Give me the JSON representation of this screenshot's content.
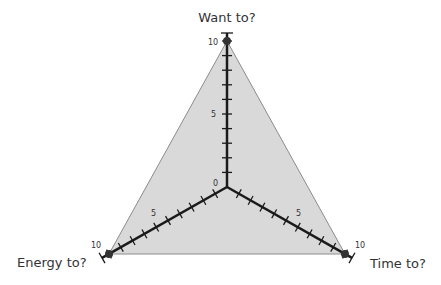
{
  "chart_data": {
    "type": "radar",
    "title": "",
    "axes": [
      {
        "name": "Want to?",
        "min": 0,
        "max": 10,
        "labeled_ticks": [
          0,
          5,
          10
        ]
      },
      {
        "name": "Time to?",
        "min": 0,
        "max": 10,
        "labeled_ticks": [
          5,
          10
        ]
      },
      {
        "name": "Energy to?",
        "min": 0,
        "max": 10,
        "labeled_ticks": [
          5,
          10
        ]
      }
    ],
    "series": [
      {
        "name": "",
        "values": {
          "Want to?": 10,
          "Time to?": 10,
          "Energy to?": 10
        },
        "fill": "#d9d9d9",
        "stroke": "#888888"
      }
    ],
    "tick_step": 1,
    "grid": false,
    "legend": "none"
  },
  "labels": {
    "want": "Want to?",
    "time": "Time to?",
    "energy": "Energy to?",
    "t0": "0",
    "t5": "5",
    "t10": "10"
  },
  "colors": {
    "fill": "#d9d9d9",
    "axis": "#1a1a1a",
    "outline": "#8c8c8c"
  }
}
